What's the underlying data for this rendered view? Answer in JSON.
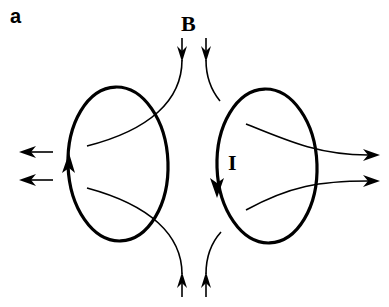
{
  "figure": {
    "panel_label": "a",
    "field_label": "B",
    "current_label": "I",
    "colors": {
      "background": "#ffffff",
      "stroke": "#000000"
    },
    "loops": [
      {
        "name": "left-loop",
        "cx": 118,
        "cy": 164,
        "rx": 50,
        "ry": 77,
        "current_direction": "up"
      },
      {
        "name": "right-loop",
        "cx": 267,
        "cy": 166,
        "rx": 50,
        "ry": 77,
        "current_direction": "down"
      }
    ],
    "field_lines": [
      {
        "name": "field-line-top-left",
        "direction": "inward-down-then-left"
      },
      {
        "name": "field-line-top-right",
        "direction": "inward-down"
      },
      {
        "name": "field-line-bottom-left",
        "direction": "inward-up"
      },
      {
        "name": "field-line-bottom-right",
        "direction": "inward-up"
      },
      {
        "name": "field-line-exit-left-upper",
        "direction": "left"
      },
      {
        "name": "field-line-exit-left-lower",
        "direction": "left"
      },
      {
        "name": "field-line-exit-right-upper",
        "direction": "right"
      },
      {
        "name": "field-line-exit-right-lower",
        "direction": "right"
      }
    ]
  }
}
